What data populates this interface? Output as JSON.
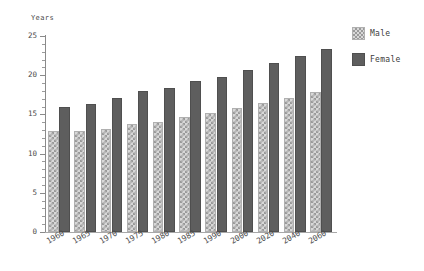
{
  "chart_data": {
    "type": "bar",
    "title": "",
    "subtitle": "",
    "xlabel": "",
    "ylabel": "Years",
    "categories": [
      "1960",
      "1965",
      "1970",
      "1975",
      "1980",
      "1985",
      "1990",
      "2000",
      "2020",
      "2040",
      "2060"
    ],
    "series": [
      {
        "name": "Male",
        "values": [
          12.9,
          12.9,
          13.1,
          13.8,
          14.0,
          14.7,
          15.2,
          15.8,
          16.4,
          17.1,
          17.9
        ]
      },
      {
        "name": "Female",
        "values": [
          15.9,
          16.3,
          17.1,
          18.0,
          18.4,
          19.2,
          19.8,
          20.7,
          21.6,
          22.5,
          23.4
        ]
      }
    ],
    "ylim": [
      0,
      25
    ],
    "ytick_labels": [
      "0",
      "5",
      "10",
      "15",
      "20",
      "25"
    ],
    "ytick_values": [
      0,
      5,
      10,
      15,
      20,
      25
    ],
    "yminor_step": 1,
    "grid": false,
    "legend_position": "top-right",
    "legend_entries": [
      "Male",
      "Female"
    ],
    "colors": {
      "male": "#d8d8d8",
      "male_hatch": "#9a9a9a",
      "female": "#5e5e5e",
      "axis": "#8a8a8a",
      "text": "#3b3b3b",
      "background": "#ffffff"
    }
  }
}
